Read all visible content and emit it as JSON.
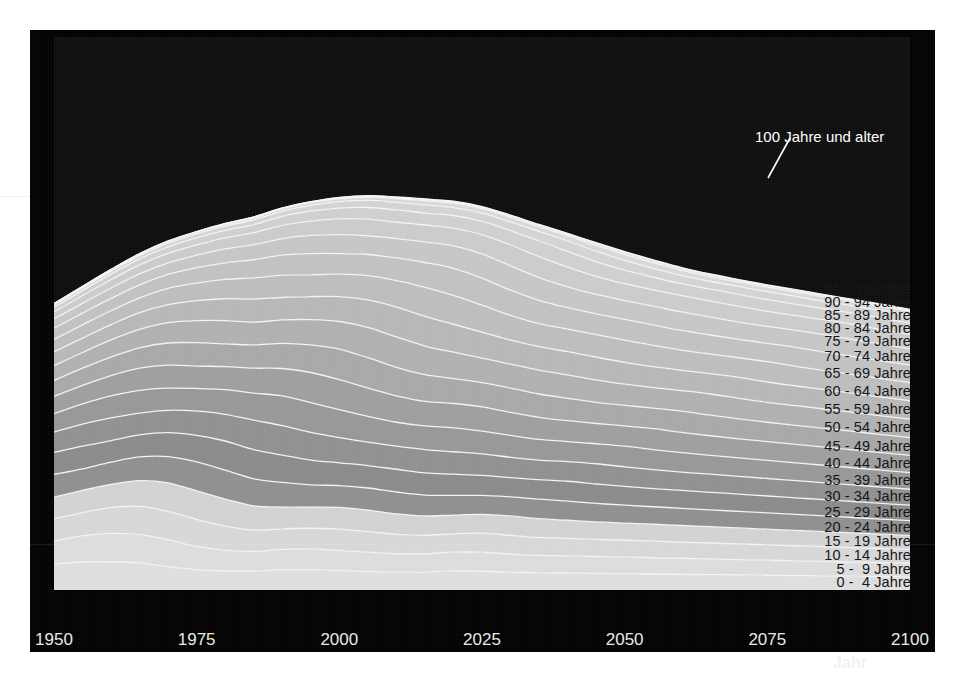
{
  "figure": {
    "background_color": "#000000",
    "paper_color": "#ffffff",
    "plot_background": "#0d0d0d"
  },
  "callout": {
    "label": "100 Jahre und alter",
    "color": "#ffffff"
  },
  "axis": {
    "x_title": "Jahr",
    "x_ticks": [
      "1950",
      "1975",
      "2000",
      "2025",
      "2050",
      "2075",
      "2100"
    ],
    "x_tick_color": "#e8e8e8",
    "x_min": 1950,
    "x_max": 2100
  },
  "chart_data": {
    "type": "area",
    "title": "",
    "subtitle": "",
    "xlabel": "Jahr",
    "ylabel": "",
    "xlim": [
      1950,
      2100
    ],
    "ylim": [
      0,
      90
    ],
    "grid": false,
    "legend": "in-plot-right",
    "stacked": true,
    "x": [
      1950,
      1955,
      1960,
      1965,
      1970,
      1975,
      1980,
      1985,
      1990,
      1995,
      2000,
      2005,
      2010,
      2015,
      2020,
      2025,
      2030,
      2035,
      2040,
      2045,
      2050,
      2055,
      2060,
      2065,
      2070,
      2075,
      2080,
      2085,
      2090,
      2095,
      2100
    ],
    "series": [
      {
        "name": "0 -  4 Jahre",
        "color": "#dedede",
        "values": [
          4.2,
          4.6,
          4.6,
          4.4,
          3.8,
          3.3,
          3.1,
          3.1,
          3.3,
          3.3,
          3.15,
          3.0,
          2.9,
          2.95,
          3.1,
          3.05,
          2.9,
          2.8,
          2.75,
          2.7,
          2.65,
          2.6,
          2.55,
          2.5,
          2.45,
          2.4,
          2.35,
          2.3,
          2.25,
          2.2,
          2.15
        ]
      },
      {
        "name": "5 -  9 Jahre",
        "color": "#dcdcdc",
        "values": [
          3.8,
          4.2,
          4.6,
          4.6,
          4.4,
          3.8,
          3.4,
          3.2,
          3.3,
          3.35,
          3.3,
          3.15,
          3.0,
          2.95,
          3.05,
          3.1,
          2.95,
          2.85,
          2.8,
          2.75,
          2.7,
          2.65,
          2.6,
          2.55,
          2.5,
          2.45,
          2.4,
          2.35,
          2.3,
          2.25,
          2.2
        ]
      },
      {
        "name": "10 - 14 Jahre",
        "color": "#d7d7d7",
        "values": [
          3.6,
          3.8,
          4.2,
          4.6,
          4.6,
          4.4,
          3.9,
          3.45,
          3.35,
          3.4,
          3.45,
          3.35,
          3.15,
          3.0,
          3.0,
          3.1,
          3.05,
          2.9,
          2.85,
          2.8,
          2.75,
          2.7,
          2.65,
          2.6,
          2.55,
          2.5,
          2.45,
          2.4,
          2.35,
          2.3,
          2.25
        ]
      },
      {
        "name": "15 - 19 Jahre",
        "color": "#d2d2d2",
        "values": [
          3.5,
          3.6,
          3.8,
          4.2,
          4.65,
          4.65,
          4.4,
          3.95,
          3.55,
          3.45,
          3.55,
          3.5,
          3.35,
          3.15,
          3.05,
          3.05,
          3.15,
          3.05,
          2.95,
          2.85,
          2.8,
          2.75,
          2.7,
          2.65,
          2.6,
          2.55,
          2.5,
          2.45,
          2.4,
          2.35,
          2.3
        ]
      },
      {
        "name": "20 - 24 Jahre",
        "color": "#8f8f8f",
        "values": [
          3.7,
          3.5,
          3.6,
          3.85,
          4.25,
          4.7,
          4.7,
          4.4,
          4.0,
          3.6,
          3.55,
          3.6,
          3.55,
          3.4,
          3.2,
          3.1,
          3.1,
          3.2,
          3.1,
          3.0,
          2.9,
          2.85,
          2.8,
          2.75,
          2.7,
          2.65,
          2.6,
          2.55,
          2.5,
          2.45,
          2.4
        ]
      },
      {
        "name": "25 - 29 Jahre",
        "color": "#8a8a8a",
        "values": [
          3.6,
          3.7,
          3.5,
          3.6,
          3.9,
          4.3,
          4.75,
          4.75,
          4.45,
          4.05,
          3.7,
          3.65,
          3.7,
          3.6,
          3.45,
          3.25,
          3.15,
          3.15,
          3.25,
          3.15,
          3.05,
          2.95,
          2.9,
          2.85,
          2.8,
          2.75,
          2.7,
          2.65,
          2.6,
          2.55,
          2.5
        ]
      },
      {
        "name": "30 - 34 Jahre",
        "color": "#909090",
        "values": [
          3.3,
          3.6,
          3.7,
          3.55,
          3.65,
          3.95,
          4.35,
          4.8,
          4.8,
          4.5,
          4.1,
          3.8,
          3.75,
          3.8,
          3.65,
          3.5,
          3.3,
          3.2,
          3.2,
          3.3,
          3.2,
          3.1,
          3.0,
          2.95,
          2.9,
          2.85,
          2.8,
          2.75,
          2.7,
          2.65,
          2.6
        ]
      },
      {
        "name": "35 - 39 Jahre",
        "color": "#979797",
        "values": [
          3.0,
          3.3,
          3.6,
          3.7,
          3.6,
          3.7,
          4.0,
          4.4,
          4.85,
          4.85,
          4.55,
          4.2,
          3.9,
          3.85,
          3.9,
          3.7,
          3.55,
          3.35,
          3.25,
          3.25,
          3.35,
          3.25,
          3.15,
          3.05,
          3.0,
          2.95,
          2.9,
          2.85,
          2.8,
          2.75,
          2.7
        ]
      },
      {
        "name": "40 - 44 Jahre",
        "color": "#9e9e9e",
        "values": [
          2.8,
          3.0,
          3.3,
          3.6,
          3.75,
          3.65,
          3.75,
          4.05,
          4.45,
          4.9,
          4.9,
          4.6,
          4.3,
          4.0,
          3.95,
          3.95,
          3.75,
          3.6,
          3.4,
          3.3,
          3.3,
          3.4,
          3.3,
          3.2,
          3.1,
          3.05,
          3.0,
          2.95,
          2.9,
          2.85,
          2.8
        ]
      },
      {
        "name": "45 - 49 Jahre",
        "color": "#a8a8a8",
        "values": [
          2.6,
          2.8,
          3.0,
          3.3,
          3.6,
          3.8,
          3.7,
          3.8,
          4.1,
          4.5,
          4.95,
          4.95,
          4.65,
          4.35,
          4.05,
          3.95,
          3.95,
          3.8,
          3.65,
          3.45,
          3.35,
          3.35,
          3.45,
          3.35,
          3.25,
          3.15,
          3.1,
          3.05,
          3.0,
          2.95,
          2.9
        ]
      },
      {
        "name": "50 - 54 Jahre",
        "color": "#b0b0b0",
        "values": [
          2.4,
          2.55,
          2.8,
          3.0,
          3.3,
          3.6,
          3.8,
          3.7,
          3.8,
          4.1,
          4.5,
          4.95,
          4.95,
          4.65,
          4.3,
          4.0,
          3.9,
          3.9,
          3.8,
          3.65,
          3.45,
          3.35,
          3.35,
          3.45,
          3.35,
          3.25,
          3.2,
          3.15,
          3.1,
          3.05,
          3.0
        ]
      },
      {
        "name": "55 - 59 Jahre",
        "color": "#b7b7b7",
        "values": [
          2.25,
          2.35,
          2.5,
          2.75,
          2.95,
          3.25,
          3.55,
          3.75,
          3.65,
          3.75,
          4.05,
          4.45,
          4.85,
          4.85,
          4.55,
          4.2,
          3.9,
          3.8,
          3.8,
          3.7,
          3.55,
          3.4,
          3.3,
          3.3,
          3.4,
          3.3,
          3.2,
          3.15,
          3.1,
          3.05,
          3.0
        ]
      },
      {
        "name": "60 - 64 Jahre",
        "color": "#bdbdbd",
        "values": [
          2.05,
          2.15,
          2.25,
          2.4,
          2.65,
          2.85,
          3.15,
          3.45,
          3.65,
          3.55,
          3.65,
          3.95,
          4.3,
          4.7,
          4.7,
          4.4,
          4.05,
          3.75,
          3.65,
          3.65,
          3.6,
          3.45,
          3.3,
          3.2,
          3.2,
          3.3,
          3.2,
          3.1,
          3.05,
          3.0,
          2.95
        ]
      },
      {
        "name": "65 - 69 Jahre",
        "color": "#c1c1c1",
        "values": [
          1.8,
          1.9,
          2.0,
          2.1,
          2.25,
          2.5,
          2.7,
          2.95,
          3.25,
          3.45,
          3.35,
          3.45,
          3.7,
          4.05,
          4.4,
          4.4,
          4.1,
          3.8,
          3.5,
          3.4,
          3.4,
          3.35,
          3.2,
          3.1,
          3.0,
          3.0,
          3.1,
          3.0,
          2.95,
          2.9,
          2.85
        ]
      },
      {
        "name": "70 - 74 Jahre",
        "color": "#c6c6c6",
        "values": [
          1.5,
          1.6,
          1.7,
          1.8,
          1.9,
          2.05,
          2.25,
          2.45,
          2.7,
          2.95,
          3.1,
          3.05,
          3.15,
          3.35,
          3.65,
          3.95,
          3.95,
          3.7,
          3.4,
          3.15,
          3.05,
          3.05,
          3.0,
          2.9,
          2.8,
          2.75,
          2.75,
          2.85,
          2.75,
          2.7,
          2.65
        ]
      },
      {
        "name": "75 - 79 Jahre",
        "color": "#cbcbcb",
        "values": [
          1.15,
          1.25,
          1.35,
          1.45,
          1.55,
          1.65,
          1.8,
          1.95,
          2.15,
          2.35,
          2.55,
          2.7,
          2.65,
          2.75,
          2.9,
          3.15,
          3.4,
          3.4,
          3.2,
          2.95,
          2.75,
          2.65,
          2.65,
          2.6,
          2.55,
          2.45,
          2.4,
          2.4,
          2.5,
          2.4,
          2.35
        ]
      },
      {
        "name": "80 - 84 Jahre",
        "color": "#cfcfcf",
        "values": [
          0.75,
          0.82,
          0.9,
          0.98,
          1.06,
          1.14,
          1.22,
          1.32,
          1.45,
          1.6,
          1.75,
          1.9,
          2.0,
          1.95,
          2.05,
          2.15,
          2.35,
          2.55,
          2.55,
          2.4,
          2.2,
          2.05,
          1.95,
          1.95,
          1.95,
          1.9,
          1.85,
          1.8,
          1.8,
          1.9,
          1.8
        ]
      },
      {
        "name": "85 - 89 Jahre",
        "color": "#d3d3d3",
        "values": [
          0.4,
          0.45,
          0.5,
          0.55,
          0.6,
          0.65,
          0.7,
          0.76,
          0.84,
          0.94,
          1.05,
          1.15,
          1.25,
          1.32,
          1.28,
          1.35,
          1.42,
          1.55,
          1.7,
          1.7,
          1.6,
          1.46,
          1.35,
          1.3,
          1.3,
          1.3,
          1.27,
          1.23,
          1.2,
          1.2,
          1.27
        ]
      },
      {
        "name": "90 - 94 Jahre",
        "color": "#d8d8d8",
        "values": [
          0.16,
          0.18,
          0.2,
          0.23,
          0.26,
          0.29,
          0.32,
          0.35,
          0.39,
          0.44,
          0.5,
          0.56,
          0.62,
          0.68,
          0.72,
          0.7,
          0.74,
          0.78,
          0.86,
          0.95,
          0.96,
          0.9,
          0.82,
          0.76,
          0.73,
          0.73,
          0.73,
          0.71,
          0.69,
          0.67,
          0.67
        ]
      },
      {
        "name": "95 - 99 Jahre",
        "color": "#dddddd",
        "values": [
          0.04,
          0.05,
          0.05,
          0.06,
          0.07,
          0.08,
          0.09,
          0.1,
          0.11,
          0.13,
          0.15,
          0.17,
          0.19,
          0.22,
          0.25,
          0.27,
          0.26,
          0.28,
          0.3,
          0.33,
          0.37,
          0.38,
          0.35,
          0.32,
          0.3,
          0.29,
          0.29,
          0.29,
          0.28,
          0.27,
          0.26
        ]
      },
      {
        "name": "100 Jahre und alter",
        "color": "#e2e2e2",
        "values": [
          0.004,
          0.005,
          0.006,
          0.007,
          0.008,
          0.01,
          0.012,
          0.014,
          0.017,
          0.02,
          0.024,
          0.028,
          0.033,
          0.038,
          0.044,
          0.05,
          0.055,
          0.054,
          0.058,
          0.064,
          0.072,
          0.08,
          0.082,
          0.076,
          0.07,
          0.066,
          0.064,
          0.064,
          0.063,
          0.062,
          0.06
        ]
      }
    ],
    "labels_right": [
      "100 Jahre und alter",
      "95 - 99 Jahre",
      "90 - 94 Jahre",
      "85 - 89 Jahre",
      "80 - 84 Jahre",
      "75 - 79 Jahre",
      "70 - 74 Jahre",
      "65 - 69 Jahre",
      "60 - 64 Jahre",
      "55 - 59 Jahre",
      "50 - 54 Jahre",
      "45 - 49 Jahre",
      "40 - 44 Jahre",
      "35 - 39 Jahre",
      "30 - 34 Jahre",
      "25 - 29 Jahre",
      "20 - 24 Jahre",
      "15 - 19 Jahre",
      "10 - 14 Jahre",
      "5 -  9 Jahre",
      "0 -  4 Jahre"
    ]
  }
}
